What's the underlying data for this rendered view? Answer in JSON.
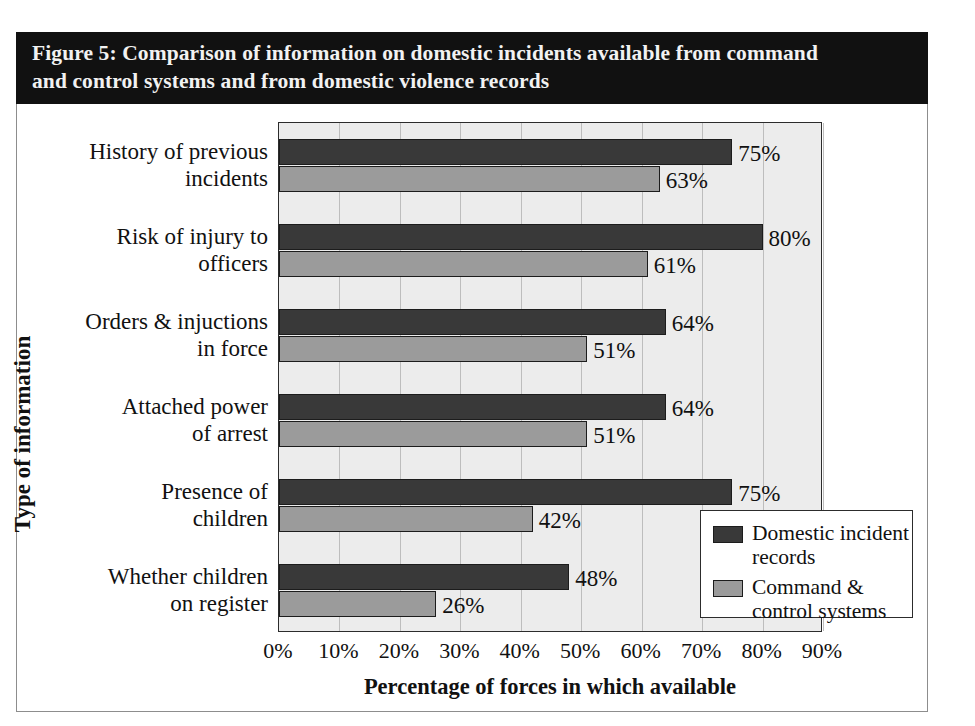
{
  "figure": {
    "title": "Figure 5: Comparison of information on domestic incidents available from command\nand control systems and from domestic violence records"
  },
  "chart_data": {
    "type": "bar",
    "orientation": "horizontal",
    "title": "Figure 5: Comparison of information on domestic incidents available from command and control systems and from domestic violence records",
    "xlabel": "Percentage of forces in which available",
    "ylabel": "Type of information",
    "xlim": [
      0,
      90
    ],
    "xticks": [
      "0%",
      "10%",
      "20%",
      "30%",
      "40%",
      "50%",
      "60%",
      "70%",
      "80%",
      "90%"
    ],
    "xtick_values": [
      0,
      10,
      20,
      30,
      40,
      50,
      60,
      70,
      80,
      90
    ],
    "grid": "vertical",
    "legend_position": "bottom-right",
    "categories": [
      "History of previous\nincidents",
      "Risk of injury to\nofficers",
      "Orders & injuctions\nin force",
      "Attached power\nof arrest",
      "Presence of\nchildren",
      "Whether children\non register"
    ],
    "series": [
      {
        "name": "Domestic incident\nrecords",
        "color": "#393939",
        "values": [
          75,
          80,
          64,
          64,
          75,
          48
        ],
        "labels": [
          "75%",
          "80%",
          "64%",
          "64%",
          "75%",
          "48%"
        ]
      },
      {
        "name": "Command &\ncontrol systems",
        "color": "#9b9b9b",
        "values": [
          63,
          61,
          51,
          51,
          42,
          26
        ],
        "labels": [
          "63%",
          "61%",
          "51%",
          "51%",
          "42%",
          "26%"
        ]
      }
    ]
  }
}
